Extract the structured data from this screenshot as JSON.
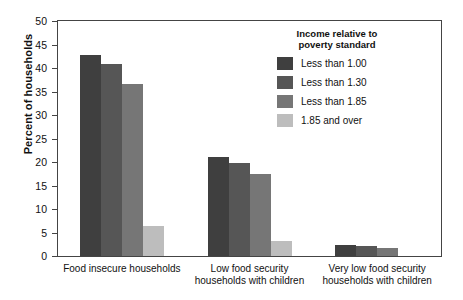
{
  "chart_data": {
    "type": "bar",
    "title": "",
    "xlabel": "",
    "ylabel": "Percent of households",
    "ylim": [
      0,
      50
    ],
    "yticks": [
      0,
      5,
      10,
      15,
      20,
      25,
      30,
      35,
      40,
      45,
      50
    ],
    "grid": false,
    "legend_position": "upper-right-inside",
    "legend_title": "Income relative to\npoverty standard",
    "categories": [
      "Food insecure households",
      "Low food security\nhouseholds with children",
      "Very low food security\nhouseholds with children"
    ],
    "series": [
      {
        "name": "Less than 1.00",
        "color": "#3f3f3f",
        "values": [
          42.7,
          21.0,
          2.3
        ]
      },
      {
        "name": "Less than 1.30",
        "color": "#565656",
        "values": [
          40.9,
          19.8,
          2.1
        ]
      },
      {
        "name": "Less than 1.85",
        "color": "#767676",
        "values": [
          36.6,
          17.5,
          1.7
        ]
      },
      {
        "name": "1.85 and over",
        "color": "#bdbdbd",
        "values": [
          6.4,
          3.3,
          0.0
        ]
      }
    ]
  },
  "colors": {
    "axis": "#444444",
    "text": "#111111",
    "background": "#ffffff"
  }
}
